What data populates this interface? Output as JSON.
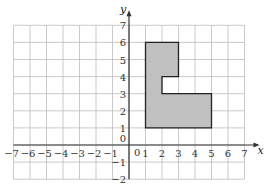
{
  "diagram": {
    "type": "coordinate-grid",
    "x_axis": {
      "label": "x",
      "min": -7,
      "max": 7,
      "ticks": [
        "-7",
        "-6",
        "-5",
        "-4",
        "-3",
        "-2",
        "-1",
        "0",
        "1",
        "2",
        "3",
        "4",
        "5",
        "6",
        "7"
      ]
    },
    "y_axis": {
      "label": "y",
      "min": -2,
      "max": 7,
      "ticks": [
        "-2",
        "-1",
        "0",
        "1",
        "2",
        "3",
        "4",
        "5",
        "6",
        "7"
      ]
    },
    "origin_label": "0",
    "shape": {
      "name": "L-shaped polygon",
      "fill": "#c0c0c0",
      "stroke": "#222222",
      "vertices": [
        [
          1,
          1
        ],
        [
          5,
          1
        ],
        [
          5,
          3
        ],
        [
          2,
          3
        ],
        [
          2,
          4
        ],
        [
          3,
          4
        ],
        [
          3,
          6
        ],
        [
          1,
          6
        ]
      ]
    },
    "colors": {
      "grid": "#bdbdbd",
      "axis": "#333333",
      "background": "#ffffff"
    }
  }
}
